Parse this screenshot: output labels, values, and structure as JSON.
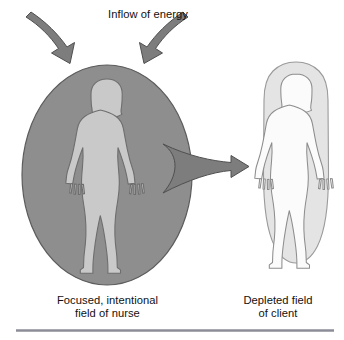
{
  "figure": {
    "title": "Inflow of energy",
    "labels": {
      "left_line1": "Focused, intentional",
      "left_line2": "field of nurse",
      "right_line1": "Depleted field",
      "right_line2": "of client"
    },
    "elements": {
      "nurse_field_name": "focused-intentional-field-ellipse",
      "client_field_name": "depleted-field-blob",
      "nurse_figure_name": "nurse-human-silhouette",
      "client_figure_name": "client-human-silhouette",
      "inflow_arrow_left": "inflow-arrow-left",
      "inflow_arrow_right": "inflow-arrow-right",
      "transfer_arrow": "energy-transfer-arrow",
      "rule": "bottom-divider-rule"
    },
    "colors": {
      "background": "#ffffff",
      "nurse_field_fill": "#8e8e8e",
      "nurse_field_stroke": "#5c5c5c",
      "nurse_figure_fill": "#c9c9c9",
      "nurse_figure_stroke": "#6e6e6e",
      "client_field_fill": "#e4e4e4",
      "client_field_stroke": "#9a9a9a",
      "client_figure_fill": "#fbfbfb",
      "client_figure_stroke": "#8d8d8d",
      "arrow_fill": "#7d7d7d",
      "arrow_stroke": "#4f4f4f",
      "rule": "#8c8c98",
      "text": "#111111"
    }
  }
}
